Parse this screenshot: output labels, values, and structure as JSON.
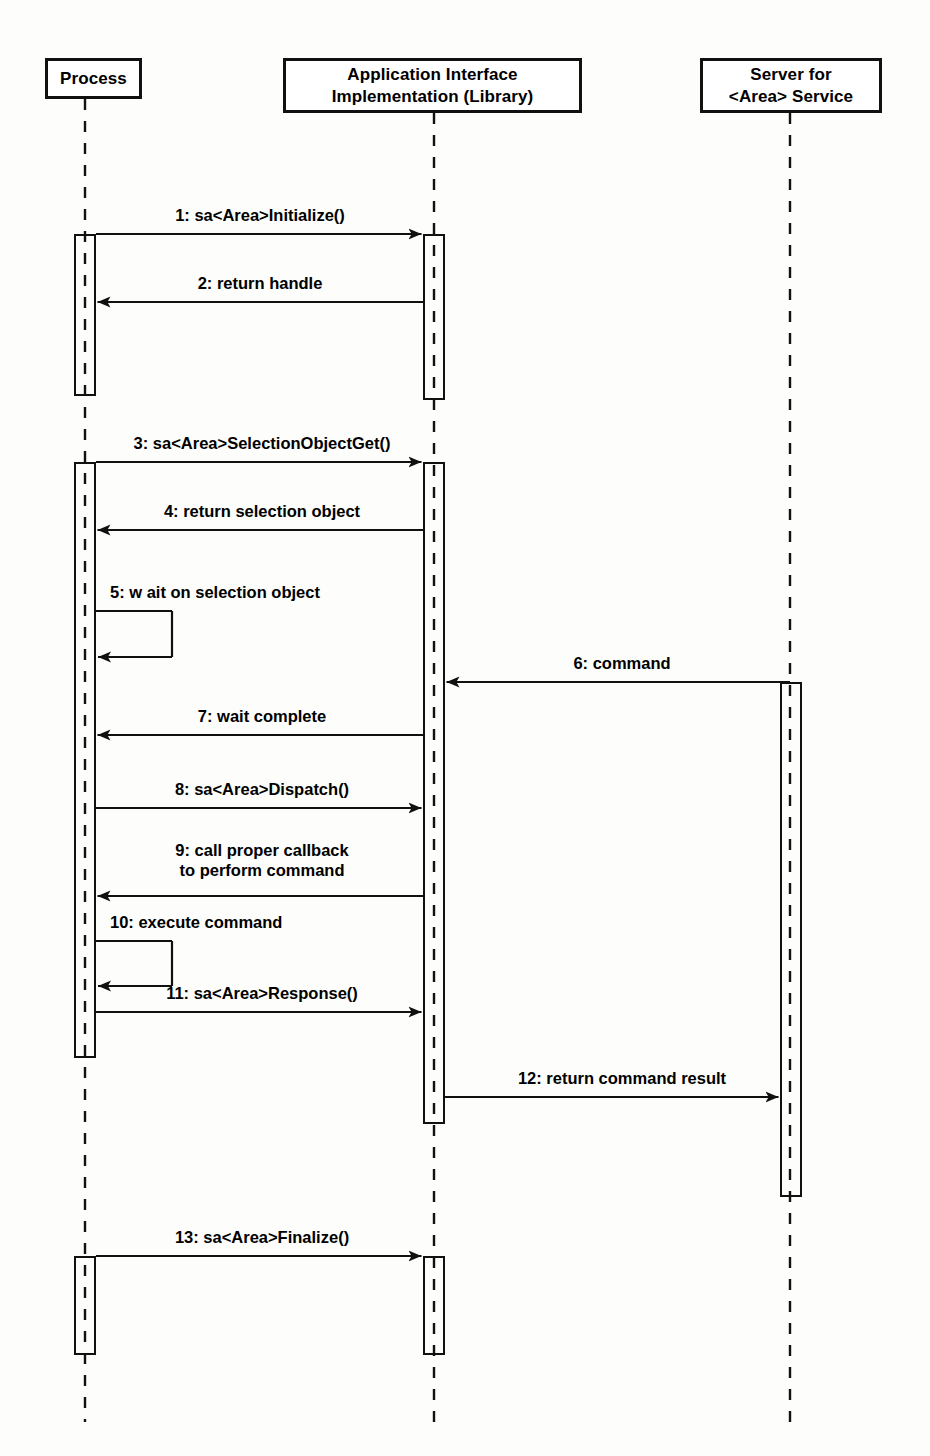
{
  "diagram": {
    "kind": "uml-sequence-diagram",
    "background_color": "#fdfdfc",
    "line_color": "#111111",
    "text_color": "#000000"
  },
  "lifelines": [
    {
      "id": "process",
      "label": "Process",
      "x": 85,
      "box": {
        "left": 45,
        "top": 58,
        "width": 97,
        "height": 41
      },
      "lifeline_bottom": 1422
    },
    {
      "id": "library",
      "label": "Application Interface\nImplementation (Library)",
      "x": 434,
      "box": {
        "left": 283,
        "top": 58,
        "width": 299,
        "height": 55
      },
      "lifeline_bottom": 1422
    },
    {
      "id": "server",
      "label": "Server for\n<Area> Service",
      "x": 790,
      "box": {
        "left": 700,
        "top": 58,
        "width": 182,
        "height": 55
      },
      "lifeline_bottom": 1422
    }
  ],
  "activations": [
    {
      "id": "proc-act-1",
      "lifeline": "process",
      "left": 74,
      "top": 234,
      "width": 22,
      "height": 162
    },
    {
      "id": "lib-act-1",
      "lifeline": "library",
      "left": 423,
      "top": 234,
      "width": 22,
      "height": 166
    },
    {
      "id": "proc-act-2",
      "lifeline": "process",
      "left": 74,
      "top": 462,
      "width": 22,
      "height": 596
    },
    {
      "id": "lib-act-2",
      "lifeline": "library",
      "left": 423,
      "top": 462,
      "width": 22,
      "height": 662
    },
    {
      "id": "srv-act-1",
      "lifeline": "server",
      "left": 780,
      "top": 682,
      "width": 22,
      "height": 515
    },
    {
      "id": "proc-act-3",
      "lifeline": "process",
      "left": 74,
      "top": 1256,
      "width": 22,
      "height": 99
    },
    {
      "id": "lib-act-3",
      "lifeline": "library",
      "left": 423,
      "top": 1256,
      "width": 22,
      "height": 99
    }
  ],
  "messages": [
    {
      "seq": "1",
      "text": "1: sa<Area>Initialize()",
      "from": "process",
      "to": "library",
      "direction": "right",
      "kind": "call",
      "y": 234,
      "x1": 96,
      "x2": 423,
      "label_x": 260,
      "label_y": 205,
      "label_align": "center"
    },
    {
      "seq": "2",
      "text": "2: return handle",
      "from": "library",
      "to": "process",
      "direction": "left",
      "kind": "return",
      "y": 302,
      "x1": 423,
      "x2": 96,
      "label_x": 260,
      "label_y": 273,
      "label_align": "center"
    },
    {
      "seq": "3",
      "text": "3: sa<Area>SelectionObjectGet()",
      "from": "process",
      "to": "library",
      "direction": "right",
      "kind": "call",
      "y": 462,
      "x1": 96,
      "x2": 423,
      "label_x": 262,
      "label_y": 433,
      "label_align": "center"
    },
    {
      "seq": "4",
      "text": "4: return selection object",
      "from": "library",
      "to": "process",
      "direction": "left",
      "kind": "return",
      "y": 530,
      "x1": 423,
      "x2": 96,
      "label_x": 262,
      "label_y": 501,
      "label_align": "center"
    },
    {
      "seq": "5",
      "text": "5: w ait on selection object",
      "from": "process",
      "to": "process",
      "direction": "self",
      "kind": "self-call",
      "y": 611,
      "y2": 657,
      "x1": 96,
      "x2": 172,
      "label_x": 110,
      "label_y": 582,
      "label_align": "left"
    },
    {
      "seq": "6",
      "text": "6: command",
      "from": "server",
      "to": "library",
      "direction": "left",
      "kind": "call",
      "y": 682,
      "x1": 790,
      "x2": 445,
      "label_x": 622,
      "label_y": 653,
      "label_align": "center"
    },
    {
      "seq": "7",
      "text": "7: wait complete",
      "from": "library",
      "to": "process",
      "direction": "left",
      "kind": "return",
      "y": 735,
      "x1": 423,
      "x2": 96,
      "label_x": 262,
      "label_y": 706,
      "label_align": "center"
    },
    {
      "seq": "8",
      "text": "8: sa<Area>Dispatch()",
      "from": "process",
      "to": "library",
      "direction": "right",
      "kind": "call",
      "y": 808,
      "x1": 96,
      "x2": 423,
      "label_x": 262,
      "label_y": 779,
      "label_align": "center"
    },
    {
      "seq": "9",
      "text": "9: call proper callback\n    to perform command",
      "from": "library",
      "to": "process",
      "direction": "left",
      "kind": "return",
      "y": 896,
      "x1": 423,
      "x2": 96,
      "label_x": 262,
      "label_y": 840,
      "label_align": "center"
    },
    {
      "seq": "10",
      "text": "10: execute command",
      "from": "process",
      "to": "process",
      "direction": "self",
      "kind": "self-call",
      "y": 941,
      "y2": 986,
      "x1": 96,
      "x2": 172,
      "label_x": 110,
      "label_y": 912,
      "label_align": "left"
    },
    {
      "seq": "11",
      "text": "11: sa<Area>Response()",
      "from": "process",
      "to": "library",
      "direction": "right",
      "kind": "call",
      "y": 1012,
      "x1": 96,
      "x2": 423,
      "label_x": 262,
      "label_y": 983,
      "label_align": "center"
    },
    {
      "seq": "12",
      "text": "12: return command result",
      "from": "library",
      "to": "server",
      "direction": "right",
      "kind": "return",
      "y": 1097,
      "x1": 445,
      "x2": 780,
      "label_x": 622,
      "label_y": 1068,
      "label_align": "center"
    },
    {
      "seq": "13",
      "text": "13: sa<Area>Finalize()",
      "from": "process",
      "to": "library",
      "direction": "right",
      "kind": "call",
      "y": 1256,
      "x1": 96,
      "x2": 423,
      "label_x": 262,
      "label_y": 1227,
      "label_align": "center"
    }
  ]
}
